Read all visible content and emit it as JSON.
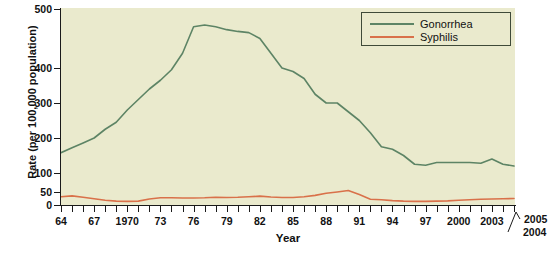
{
  "chart_data": {
    "type": "line",
    "title": "",
    "xlabel": "Year",
    "ylabel": "Rate (per 100,000 population)",
    "xlim": [
      1964,
      2005
    ],
    "ylim": [
      0,
      500
    ],
    "grid": false,
    "legend_position": "top-right",
    "y_ticks": [
      {
        "value": 0,
        "label": "0"
      },
      {
        "value": 50,
        "label": "50"
      },
      {
        "value": 100,
        "label": "100"
      },
      {
        "value": 200,
        "label": "200"
      },
      {
        "value": 300,
        "label": "300"
      },
      {
        "value": 400,
        "label": "400"
      },
      {
        "value": 500,
        "label": "500"
      }
    ],
    "x_tick_labels": [
      {
        "year": 1964,
        "label": "64"
      },
      {
        "year": 1967,
        "label": "67"
      },
      {
        "year": 1970,
        "label": "1970"
      },
      {
        "year": 1973,
        "label": "73"
      },
      {
        "year": 1976,
        "label": "76"
      },
      {
        "year": 1979,
        "label": "79"
      },
      {
        "year": 1982,
        "label": "82"
      },
      {
        "year": 1985,
        "label": "85"
      },
      {
        "year": 1988,
        "label": "88"
      },
      {
        "year": 1991,
        "label": "91"
      },
      {
        "year": 1994,
        "label": "94"
      },
      {
        "year": 1997,
        "label": "97"
      },
      {
        "year": 2000,
        "label": "2000"
      },
      {
        "year": 2003,
        "label": "2003"
      },
      {
        "year": 2004,
        "label": "2004"
      },
      {
        "year": 2005,
        "label": "2005"
      }
    ],
    "x": [
      1964,
      1965,
      1966,
      1967,
      1968,
      1969,
      1970,
      1971,
      1972,
      1973,
      1974,
      1975,
      1976,
      1977,
      1978,
      1979,
      1980,
      1981,
      1982,
      1983,
      1984,
      1985,
      1986,
      1987,
      1988,
      1989,
      1990,
      1991,
      1992,
      1993,
      1994,
      1995,
      1996,
      1997,
      1998,
      1999,
      2000,
      2001,
      2002,
      2003,
      2004,
      2005
    ],
    "series": [
      {
        "name": "Gonorrhea",
        "color": "#5d8465",
        "values": [
          158,
          172,
          186,
          200,
          225,
          245,
          280,
          310,
          340,
          365,
          395,
          425,
          470,
          473,
          470,
          465,
          462,
          460,
          450,
          425,
          400,
          390,
          370,
          325,
          300,
          300,
          275,
          250,
          215,
          175,
          168,
          150,
          125,
          122,
          130,
          130,
          130,
          130,
          128,
          140,
          125,
          120
        ]
      },
      {
        "name": "Syphilis",
        "color": "#d9714a",
        "values": [
          32,
          35,
          30,
          24,
          18,
          15,
          14,
          15,
          23,
          28,
          28,
          27,
          27,
          28,
          30,
          29,
          30,
          32,
          34,
          31,
          29,
          29,
          32,
          37,
          45,
          50,
          54,
          40,
          22,
          20,
          17,
          15,
          14,
          14,
          15,
          16,
          18,
          20,
          22,
          23,
          24,
          25
        ]
      }
    ]
  },
  "legend": {
    "entries": [
      {
        "label": "Gonorrhea",
        "color": "#5d8465"
      },
      {
        "label": "Syphilis",
        "color": "#d9714a"
      }
    ]
  },
  "axis_titles": {
    "x": "Year",
    "y": "Rate (per 100,000 population)"
  },
  "colors": {
    "plot_background": "#eaeacd",
    "gonorrhea": "#5d8465",
    "syphilis": "#d9714a",
    "axis": "#1a1a1a",
    "legend_border": "#3f4a38"
  }
}
